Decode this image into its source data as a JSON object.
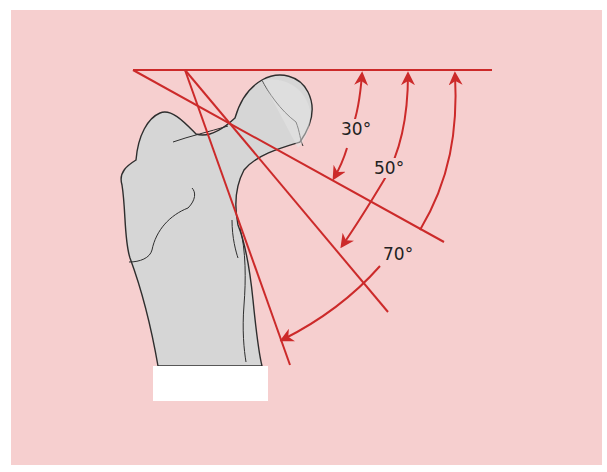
{
  "diagram": {
    "colors": {
      "background": "#f6cfcf",
      "bone_fill": "#d9d9d9",
      "bone_outline": "#333333",
      "line": "#cc2a2a",
      "label_box": "#ffffff"
    },
    "angles": [
      {
        "id": "angle-30",
        "label": "30°"
      },
      {
        "id": "angle-50",
        "label": "50°"
      },
      {
        "id": "angle-70",
        "label": "70°"
      }
    ],
    "label_box_text": ""
  }
}
